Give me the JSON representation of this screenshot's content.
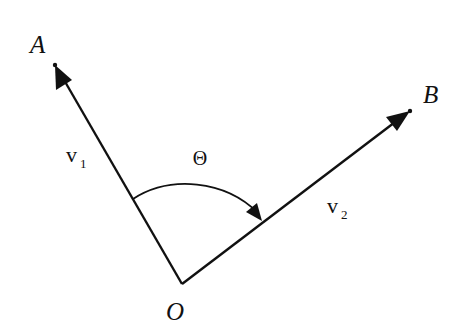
{
  "diagram": {
    "type": "vector-angle",
    "points": {
      "A": {
        "label": "A",
        "x": 55,
        "y": 65
      },
      "B": {
        "label": "B",
        "x": 410,
        "y": 111
      },
      "O": {
        "label": "O",
        "x": 182,
        "y": 284
      }
    },
    "vectors": [
      {
        "name": "v1",
        "label_base": "v",
        "label_sub": "1",
        "from": "O",
        "to": "A"
      },
      {
        "name": "v2",
        "label_base": "v",
        "label_sub": "2",
        "from": "O",
        "to": "B"
      }
    ],
    "angle": {
      "label": "Θ",
      "from_vector": "v1",
      "to_vector": "v2",
      "direction": "clockwise"
    },
    "colors": {
      "stroke": "#111111",
      "background": "#ffffff"
    }
  }
}
